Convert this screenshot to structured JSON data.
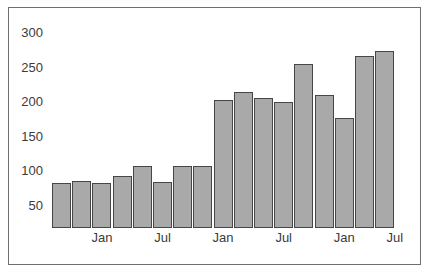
{
  "chart_data": {
    "type": "bar",
    "title": "",
    "subtitle": "",
    "xlabel": "",
    "ylabel": "",
    "categories": [
      "Sep",
      "Oct",
      "Nov",
      "Dec",
      "Jan",
      "Feb",
      "Mar",
      "Apr",
      "May",
      "Jun",
      "Jul",
      "Aug",
      "Sep",
      "Oct",
      "Nov",
      "Dec",
      "Jan"
    ],
    "values": [
      83,
      86,
      83,
      94,
      108,
      85,
      108,
      108,
      203,
      215,
      207,
      200,
      256,
      211,
      177,
      268,
      274
    ],
    "ylim": [
      18,
      300
    ],
    "xlim": [
      0,
      17
    ],
    "grid": false,
    "legend": null,
    "y_ticks": [
      50,
      100,
      150,
      200,
      250,
      300
    ],
    "y_tick_labels": [
      "50",
      "100",
      "150",
      "200",
      "250",
      "300"
    ],
    "x_ticks": [
      2.5,
      5.5,
      8.5,
      11.5,
      14.5,
      17.0
    ],
    "x_tick_labels": [
      "Jan",
      "Jul",
      "Jan",
      "Jul",
      "Jan",
      "Jul"
    ],
    "bar_count": 17,
    "bars": [
      {
        "label": "bar-1",
        "category": "Sep",
        "value": 83
      },
      {
        "label": "bar-2",
        "category": "Oct",
        "value": 86
      },
      {
        "label": "bar-3",
        "category": "Nov",
        "value": 83
      },
      {
        "label": "bar-4",
        "category": "Dec",
        "value": 94
      },
      {
        "label": "bar-5",
        "category": "Jan",
        "value": 108
      },
      {
        "label": "bar-6",
        "category": "Feb",
        "value": 85
      },
      {
        "label": "bar-7",
        "category": "Mar",
        "value": 108
      },
      {
        "label": "bar-8",
        "category": "Apr",
        "value": 108
      },
      {
        "label": "bar-9",
        "category": "May",
        "value": 203
      },
      {
        "label": "bar-10",
        "category": "Jun",
        "value": 215
      },
      {
        "label": "bar-11",
        "category": "Jul",
        "value": 207
      },
      {
        "label": "bar-12",
        "category": "Aug",
        "value": 200
      },
      {
        "label": "bar-13",
        "category": "Sep",
        "value": 256
      },
      {
        "label": "bar-14",
        "category": "Oct",
        "value": 211
      },
      {
        "label": "bar-15",
        "category": "Nov",
        "value": 177
      },
      {
        "label": "bar-16",
        "category": "Dec",
        "value": 268
      },
      {
        "label": "bar-17",
        "category": "Jan",
        "value": 274
      }
    ],
    "colors": {
      "bar_fill": "#a9a9a9",
      "bar_border": "#464646",
      "background": "#ffffff",
      "frame_border": "#6e6e6e",
      "tick_label": "#3b3b3b"
    }
  },
  "geometry": {
    "bar_left_start": 52,
    "bar_pitch": 20.2,
    "bar_width": 19.0,
    "baseline_y": 228,
    "px_per_unit": 0.69,
    "value_at_baseline": 18,
    "y_label_right_x": 48,
    "x_label_y": 231
  }
}
